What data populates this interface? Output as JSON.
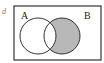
{
  "diagram": {
    "type": "venn",
    "index_label": "d",
    "sets": [
      {
        "name": "A",
        "cx": 38,
        "cy": 36,
        "r": 18
      },
      {
        "name": "B",
        "cx": 62,
        "cy": 36,
        "r": 18
      }
    ],
    "shaded_region": "B - A",
    "colors": {
      "shade": "#b8b8b8",
      "stroke": "#333333",
      "background": "#ffffff"
    },
    "universe": {
      "x": 14,
      "y": 6,
      "width": 87,
      "height": 54
    }
  }
}
